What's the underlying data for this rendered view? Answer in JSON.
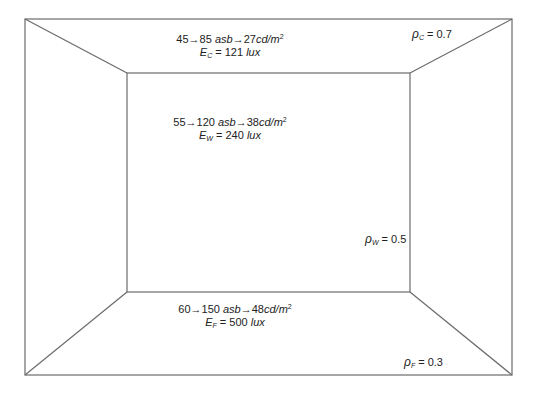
{
  "diagram": {
    "type": "room-perspective-luminance",
    "colors": {
      "line": "#6b6b6b",
      "background": "#ffffff",
      "text": "#222222"
    },
    "ceiling": {
      "line1": {
        "range": "45→85",
        "unit1": "asb",
        "arrow": "→",
        "luminance": "27",
        "unit2": "cd/m",
        "exp": "2"
      },
      "line2": {
        "symbol": "E",
        "sub": "C",
        "eq": " = 121 ",
        "unit": "lux"
      },
      "reflectance": {
        "symbol": "ρ",
        "sub": "C",
        "value": " = 0.7"
      }
    },
    "wall": {
      "line1": {
        "range": "55→120",
        "unit1": "asb",
        "arrow": "→",
        "luminance": "38",
        "unit2": "cd/m",
        "exp": "2"
      },
      "line2": {
        "symbol": "E",
        "sub": "W",
        "eq": " = 240 ",
        "unit": "lux"
      },
      "reflectance": {
        "symbol": "ρ",
        "sub": "W",
        "value": " = 0.5"
      }
    },
    "floor": {
      "line1": {
        "range": "60→150",
        "unit1": "asb",
        "arrow": "→",
        "luminance": "48",
        "unit2": "cd/m",
        "exp": "2"
      },
      "line2": {
        "symbol": "E",
        "sub": "F",
        "eq": " = 500 ",
        "unit": "lux"
      },
      "reflectance": {
        "symbol": "ρ",
        "sub": "F",
        "value": " = 0.3"
      }
    }
  }
}
